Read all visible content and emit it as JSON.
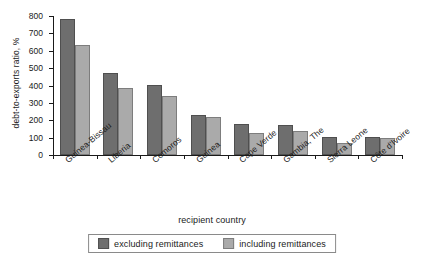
{
  "chart_data": {
    "type": "bar",
    "title": "",
    "xlabel": "recipient country",
    "ylabel": "debt-to-exports ratio, %",
    "ylim": [
      0,
      800
    ],
    "yticks": [
      0,
      100,
      200,
      300,
      400,
      500,
      600,
      700,
      800
    ],
    "grid": false,
    "legend_position": "bottom",
    "categories": [
      "Guinea-Bissau",
      "Liberia",
      "Comoros",
      "Guinea",
      "Cape Verde",
      "Gambia, The",
      "Sierra Leone",
      "Côte d'Ivoire"
    ],
    "series": [
      {
        "name": "excluding remittances",
        "color": "#6e6e6e",
        "values": [
          785,
          472,
          402,
          228,
          178,
          172,
          104,
          106
        ]
      },
      {
        "name": "including remittances",
        "color": "#aaaaaa",
        "values": [
          633,
          387,
          341,
          217,
          125,
          139,
          70,
          99
        ]
      }
    ]
  }
}
